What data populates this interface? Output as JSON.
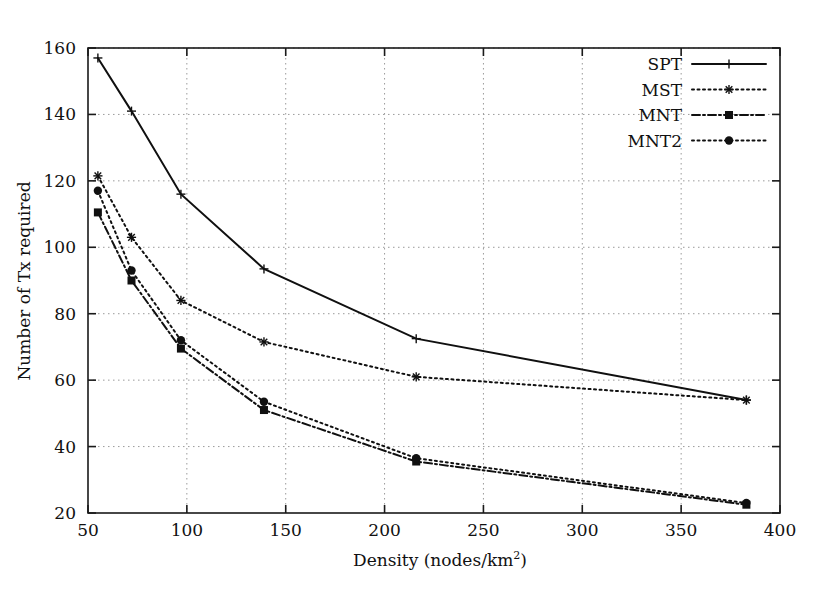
{
  "chart_data": {
    "type": "line",
    "title": "",
    "xlabel": "Density (nodes/km^2)",
    "xlabel_base": "Density (nodes/km",
    "xlabel_sup": "2",
    "xlabel_tail": ")",
    "ylabel": "Number of Tx required",
    "xlim": [
      50,
      400
    ],
    "ylim": [
      20,
      160
    ],
    "xticks": [
      50,
      100,
      150,
      200,
      250,
      300,
      350,
      400
    ],
    "xtick_labels": [
      "50",
      "100",
      "150",
      "200",
      "250",
      "300",
      "350",
      "400"
    ],
    "yticks": [
      20,
      40,
      60,
      80,
      100,
      120,
      140,
      160
    ],
    "ytick_labels": [
      "20",
      "40",
      "60",
      "80",
      "100",
      "120",
      "140",
      "160"
    ],
    "grid": true,
    "grid_style": "dotted",
    "legend_position": "top-right",
    "x": [
      55,
      72,
      97,
      139,
      216,
      383
    ],
    "series": [
      {
        "name": "SPT",
        "values": [
          157,
          141,
          116,
          93.5,
          72.5,
          54
        ],
        "line_style": "solid",
        "marker": "plus",
        "color": "#101010"
      },
      {
        "name": "MST",
        "values": [
          121.5,
          103,
          84,
          71.5,
          61,
          54
        ],
        "line_style": "dotted",
        "marker": "asterisk",
        "color": "#101010"
      },
      {
        "name": "MNT",
        "values": [
          110.5,
          90,
          69.5,
          51,
          35.5,
          22.5
        ],
        "line_style": "dash-dot",
        "marker": "filled-square",
        "color": "#101010"
      },
      {
        "name": "MNT2",
        "values": [
          117,
          93,
          72,
          53.5,
          36.5,
          23
        ],
        "line_style": "dotted",
        "marker": "filled-circle",
        "color": "#101010"
      }
    ]
  },
  "legend": {
    "entries": [
      {
        "label": "SPT"
      },
      {
        "label": "MST"
      },
      {
        "label": "MNT"
      },
      {
        "label": "MNT2"
      }
    ]
  },
  "colors": {
    "ink": "#101010",
    "grid": "#9a9a9a",
    "frame": "#1a1a1a",
    "background": "#ffffff"
  }
}
